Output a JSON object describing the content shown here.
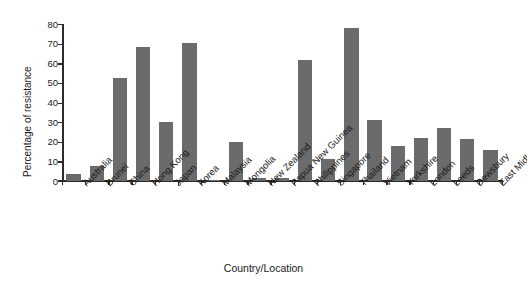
{
  "chart_data": {
    "type": "bar",
    "title": "",
    "subtitle": "",
    "xlabel": "Country/Location",
    "ylabel": "Percentage of resistance",
    "ylim": [
      0,
      80
    ],
    "yticks": [
      0,
      10,
      20,
      30,
      40,
      50,
      60,
      70,
      80
    ],
    "ytick_labels": [
      "0",
      "10",
      "20",
      "30",
      "40",
      "50",
      "60",
      "70",
      "80"
    ],
    "grid": false,
    "legend": null,
    "bar_color": "#6b6b6b",
    "axis_color": "#2b2b2b",
    "background_color": "#ffffff",
    "categories": [
      "Australia",
      "Brunei",
      "China",
      "Hong Kong",
      "Japan",
      "Korea",
      "Malaysia",
      "Mongolia",
      "New Zealand",
      "Papua New Guinea",
      "Philippines",
      "Singapore",
      "Thailand",
      "Vietnam",
      "Yorkshire",
      "London",
      "Leeds",
      "Dewsbury",
      "East Midlands"
    ],
    "values": [
      3.5,
      7.5,
      52,
      68,
      30,
      70,
      0.5,
      19.5,
      1.3,
      1.3,
      61.5,
      11,
      77.5,
      31,
      17.5,
      21.5,
      27,
      21,
      15.5
    ]
  }
}
